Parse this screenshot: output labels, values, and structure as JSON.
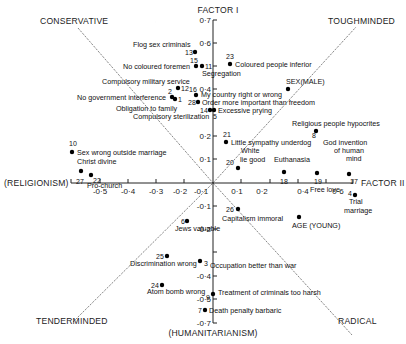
{
  "figure": {
    "factor1_label": "FACTOR I",
    "factor2_label": "FACTOR II",
    "pole_left": "(RELIGIONISM)",
    "pole_bottom": "(HUMANITARIANISM)",
    "quadrants": {
      "top_left": "CONSERVATIVE",
      "top_right": "TOUGHMINDED",
      "bottom_left": "TENDERMINDED",
      "bottom_right": "RADICAL"
    },
    "y_ticks": [
      "0·7",
      "0·6",
      "0·4",
      "0·2",
      "0·1",
      "-0·1",
      "-0·2",
      "-0·4",
      "-0·5",
      "-0·7"
    ],
    "x_ticks_neg": [
      "-0·5",
      "-0·4",
      "-0·3",
      "-0·2",
      "-0·1"
    ],
    "x_ticks_pos": [
      "0·1",
      "0·2",
      "0·4",
      "0·6"
    ],
    "items": [
      {
        "id": "13",
        "label": "Flog sex criminals"
      },
      {
        "id": "15",
        "label": "No coloured foremen"
      },
      {
        "id": "11",
        "label": "Segregation"
      },
      {
        "id": "23",
        "label": "Coloured people inferior"
      },
      {
        "id": "12",
        "label": "Compulsory military service"
      },
      {
        "id": "2",
        "label": "No government interference"
      },
      {
        "id": "1",
        "label": "Obligation to family"
      },
      {
        "id": "16",
        "label": "My country right or wrong"
      },
      {
        "id": "28",
        "label": "Order more important than freedom"
      },
      {
        "id": "14",
        "label": "Compulsory sterilization"
      },
      {
        "id": "5",
        "label": "Excessive prying"
      },
      {
        "id": "SEX",
        "label": "SEX(MALE)"
      },
      {
        "id": "8",
        "label": "Religious people hypocrites"
      },
      {
        "id": "21",
        "label": "Little sympathy underdog"
      },
      {
        "id": "20",
        "label": "White lie good"
      },
      {
        "id": "18",
        "label": "Euthanasia"
      },
      {
        "id": "19",
        "label": "Free love"
      },
      {
        "id": "17",
        "label": "God invention of human mind"
      },
      {
        "id": "4",
        "label": "Trial marriage"
      },
      {
        "id": "10",
        "label": "Sex wrong outside marriage"
      },
      {
        "id": "27",
        "label": "Christ divine"
      },
      {
        "id": "22",
        "label": "Pro-church"
      },
      {
        "id": "26",
        "label": "Capitalism immoral"
      },
      {
        "id": "AGE",
        "label": "AGE (YOUNG)"
      },
      {
        "id": "6",
        "label": "Jews valuable"
      },
      {
        "id": "25",
        "label": "Discrimination wrong"
      },
      {
        "id": "3",
        "label": "Occupation better than war"
      },
      {
        "id": "24",
        "label": "Atom bomb wrong"
      },
      {
        "id": "9",
        "label": "Treatment of criminals too harsh"
      },
      {
        "id": "7",
        "label": "Death penalty barbaric"
      }
    ]
  }
}
